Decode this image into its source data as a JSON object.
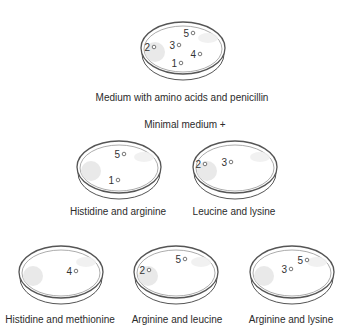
{
  "diagram": {
    "master_plate": {
      "label": "Medium with amino acids and penicillin",
      "colonies": [
        "1",
        "2",
        "3",
        "4",
        "5"
      ]
    },
    "section_header": "Minimal medium +",
    "replica_plates": [
      {
        "label": "Histidine and arginine",
        "colonies": [
          "5",
          "1"
        ]
      },
      {
        "label": "Leucine and lysine",
        "colonies": [
          "2",
          "3"
        ]
      },
      {
        "label": "Histidine and methionine",
        "colonies": [
          "4"
        ]
      },
      {
        "label": "Arginine and leucine",
        "colonies": [
          "2",
          "5"
        ]
      },
      {
        "label": "Arginine and lysine",
        "colonies": [
          "3",
          "5"
        ]
      }
    ]
  },
  "colors": {
    "dish_outline": "#555555",
    "shadow": "#e4e4e4",
    "text": "#2b2b2b"
  }
}
